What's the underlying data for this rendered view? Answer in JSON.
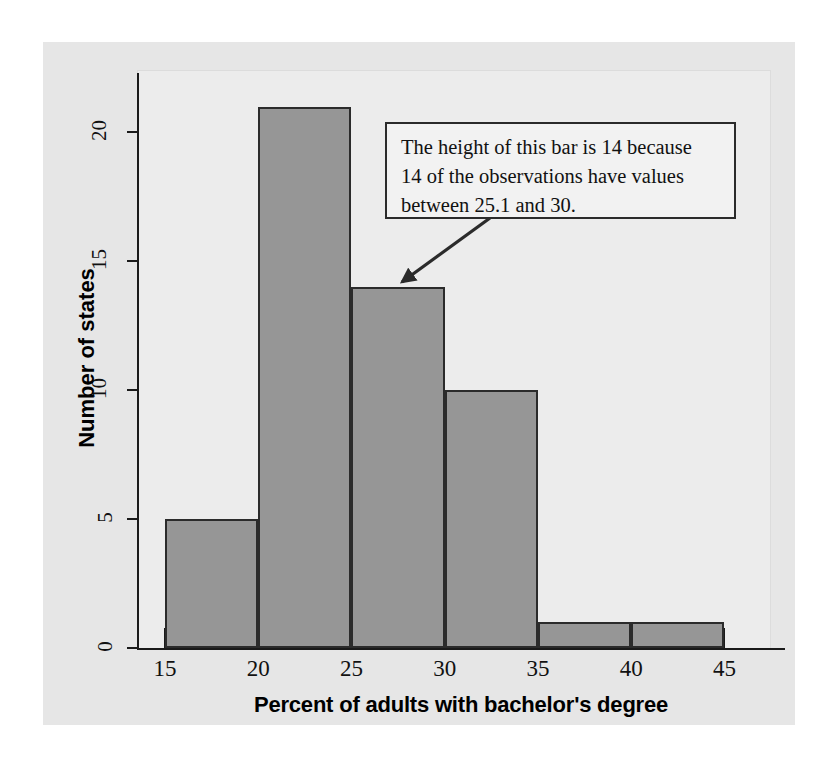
{
  "figure": {
    "background_color": "#e6e6e6",
    "plot_background_color": "#ececec",
    "bar_fill_color": "#969696",
    "bar_edge_color": "#2b2b2b"
  },
  "annotation": {
    "line1": "The height of this bar is 14 because",
    "line2": "14 of the observations have values",
    "line3": "between 25.1 and 30.",
    "points_to_bin": "25-30",
    "points_to_value": 14
  },
  "chart_data": {
    "type": "bar",
    "title": "",
    "xlabel": "Percent of adults with bachelor's degree",
    "ylabel": "Number of states",
    "categories": [
      "15-20",
      "20-25",
      "25-30",
      "30-35",
      "35-40",
      "40-45"
    ],
    "bin_edges": [
      15,
      20,
      25,
      30,
      35,
      40,
      45
    ],
    "values": [
      5,
      21,
      14,
      10,
      1,
      1
    ],
    "xlim": [
      13.5,
      47.5
    ],
    "ylim": [
      0,
      22.3
    ],
    "xticks": [
      15,
      20,
      25,
      30,
      35,
      40,
      45
    ],
    "xtick_labels": [
      "15",
      "20",
      "25",
      "30",
      "35",
      "40",
      "45"
    ],
    "yticks": [
      0,
      5,
      10,
      15,
      20
    ],
    "ytick_labels": [
      "0",
      "5",
      "10",
      "15",
      "20"
    ],
    "grid": false,
    "legend": null
  }
}
